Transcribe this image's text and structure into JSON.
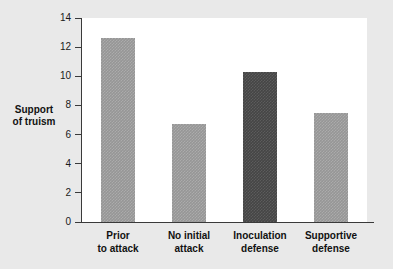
{
  "chart_data": {
    "type": "bar",
    "title": "",
    "xlabel": "",
    "ylabel": "Support of truism",
    "ylabel_lines": [
      "Support",
      "of truism"
    ],
    "categories": [
      "Prior to attack",
      "No initial attack",
      "Inoculation defense",
      "Supportive defense"
    ],
    "category_lines": [
      [
        "Prior",
        "to attack"
      ],
      [
        "No initial",
        "attack"
      ],
      [
        "Inoculation",
        "defense"
      ],
      [
        "Supportive",
        "defense"
      ]
    ],
    "values": [
      12.6,
      6.7,
      10.3,
      7.5
    ],
    "ylim": [
      0,
      14
    ],
    "yticks": [
      0,
      2,
      4,
      6,
      8,
      10,
      12,
      14
    ],
    "ytick_labels": [
      "0",
      "2",
      "4",
      "6",
      "8",
      "10",
      "12",
      "14"
    ],
    "grid": false,
    "legend": null,
    "bar_colors": [
      "#969696",
      "#969696",
      "#454545",
      "#969696"
    ],
    "plot_background": "#ffffff",
    "figure_background": "#e9e9e9",
    "axis_color": "#3a3a3a"
  }
}
